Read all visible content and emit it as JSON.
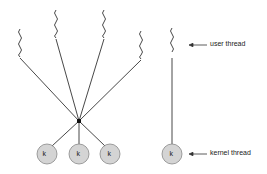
{
  "diagram": {
    "type": "many-to-one threading model",
    "labels": {
      "user_thread": "user thread",
      "kernel_thread": "kernel thread"
    },
    "kernel_symbol": "k",
    "colors": {
      "line": "#333333",
      "kernel_fill": "#d4d4d4",
      "kernel_stroke": "#888888"
    },
    "left_group": {
      "user_threads": 4,
      "kernel_threads": 3
    },
    "right_group": {
      "user_threads": 1,
      "kernel_threads": 1
    }
  }
}
